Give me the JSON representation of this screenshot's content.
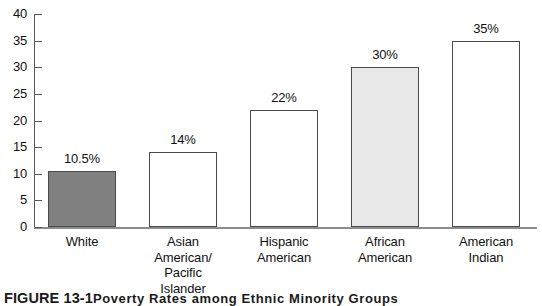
{
  "chart_data": {
    "type": "bar",
    "title": "",
    "xlabel": "",
    "ylabel": "",
    "ylim": [
      0,
      40
    ],
    "ytick_step": 5,
    "grid": false,
    "legend": "none",
    "categories": [
      "White",
      "Asian\nAmerican/\nPacific\nIslander",
      "Hispanic\nAmerican",
      "African\nAmerican",
      "American\nIndian"
    ],
    "values": [
      10.5,
      14,
      22,
      30,
      35
    ],
    "data_labels": [
      "10.5%",
      "14%",
      "22%",
      "30%",
      "35%"
    ],
    "bar_colors": [
      "#808080",
      "#ffffff",
      "#ffffff",
      "#e8e8e8",
      "#ffffff"
    ],
    "bar_edge_color": "#4a4a4a",
    "yticks": [
      "0",
      "5",
      "10",
      "15",
      "20",
      "25",
      "30",
      "35",
      "40"
    ]
  },
  "caption": {
    "label": "FIGURE 13-1",
    "text": "Poverty Rates among Ethnic Minority Groups"
  }
}
